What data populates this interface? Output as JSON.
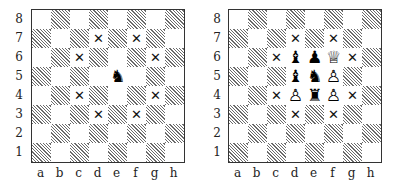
{
  "figure": {
    "files": [
      "a",
      "b",
      "c",
      "d",
      "e",
      "f",
      "g",
      "h"
    ],
    "ranks": [
      "8",
      "7",
      "6",
      "5",
      "4",
      "3",
      "2",
      "1"
    ],
    "colors": {
      "dark_square_hatch": "#6b6b6b",
      "light_square": "#ffffff",
      "border": "#333333",
      "label_text": "#222222"
    },
    "glyphs": {
      "knight-black": "♞",
      "bishop-black": "♝",
      "pawn-black": "♟",
      "rook-black": "♜",
      "queen-white": "♕",
      "pawn-white": "♙",
      "x-mark": "✕"
    }
  },
  "diagrams": [
    {
      "id": "left",
      "pieces": [
        {
          "square": "e5",
          "piece": "knight",
          "color": "black",
          "glyph": "♞"
        }
      ],
      "marks": [
        {
          "square": "d7",
          "glyph": "✕"
        },
        {
          "square": "f7",
          "glyph": "✕"
        },
        {
          "square": "c6",
          "glyph": "✕"
        },
        {
          "square": "g6",
          "glyph": "✕"
        },
        {
          "square": "c4",
          "glyph": "✕"
        },
        {
          "square": "g4",
          "glyph": "✕"
        },
        {
          "square": "d3",
          "glyph": "✕"
        },
        {
          "square": "f3",
          "glyph": "✕"
        }
      ]
    },
    {
      "id": "right",
      "pieces": [
        {
          "square": "d6",
          "piece": "bishop",
          "color": "black",
          "glyph": "♝"
        },
        {
          "square": "e6",
          "piece": "pawn",
          "color": "black",
          "glyph": "♟"
        },
        {
          "square": "f6",
          "piece": "queen",
          "color": "white",
          "glyph": "♕"
        },
        {
          "square": "d5",
          "piece": "bishop",
          "color": "black",
          "glyph": "♝"
        },
        {
          "square": "e5",
          "piece": "knight",
          "color": "black",
          "glyph": "♞"
        },
        {
          "square": "f5",
          "piece": "pawn",
          "color": "white",
          "glyph": "♙"
        },
        {
          "square": "d4",
          "piece": "pawn",
          "color": "white",
          "glyph": "♙"
        },
        {
          "square": "e4",
          "piece": "rook",
          "color": "black",
          "glyph": "♜"
        },
        {
          "square": "f4",
          "piece": "pawn",
          "color": "white",
          "glyph": "♙"
        }
      ],
      "marks": [
        {
          "square": "d7",
          "glyph": "✕"
        },
        {
          "square": "f7",
          "glyph": "✕"
        },
        {
          "square": "c6",
          "glyph": "✕"
        },
        {
          "square": "g6",
          "glyph": "✕"
        },
        {
          "square": "c4",
          "glyph": "✕"
        },
        {
          "square": "g4",
          "glyph": "✕"
        },
        {
          "square": "d3",
          "glyph": "✕"
        },
        {
          "square": "f3",
          "glyph": "✕"
        }
      ]
    }
  ]
}
